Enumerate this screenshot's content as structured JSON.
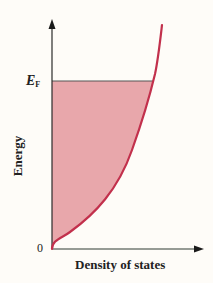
{
  "diagram": {
    "title": "",
    "y_axis": {
      "label": "Energy",
      "origin_label": "0",
      "fermi_label_main": "E",
      "fermi_label_sub": "F"
    },
    "x_axis": {
      "label": "Density of states"
    },
    "curve": {
      "shape": "sqrt",
      "description": "Density of states proportional to square root of energy",
      "color": "#c2304c"
    },
    "fill": {
      "description": "Occupied states from 0 to Fermi energy",
      "color": "#e8a7ab"
    },
    "axis_color": "#2a2a2a",
    "background": "#fefcf8"
  }
}
